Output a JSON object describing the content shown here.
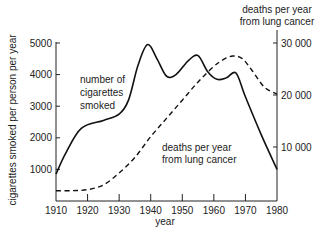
{
  "chart_data": {
    "type": "line",
    "title": "",
    "xlabel": "year",
    "ylabel": "cigarettes smoked per person per year",
    "y2label": [
      "deaths per year",
      "from lung cancer"
    ],
    "x_ticks": [
      1910,
      1920,
      1930,
      1940,
      1950,
      1960,
      1970,
      1980
    ],
    "y_ticks": [
      1000,
      2000,
      3000,
      4000,
      5000
    ],
    "y2_ticks": [
      10000,
      20000,
      30000
    ],
    "y2_tick_labels": [
      "10 000",
      "20 000",
      "30 000"
    ],
    "xlim": [
      1910,
      1980
    ],
    "ylim": [
      0,
      5000
    ],
    "y2lim": [
      0,
      30000
    ],
    "grid": false,
    "series": [
      {
        "name": "number of cigarettes smoked",
        "label_lines": [
          "number of",
          "cigarettes",
          "smoked"
        ],
        "axis": "left",
        "style": "solid",
        "x": [
          1910,
          1913,
          1918,
          1925,
          1930,
          1933,
          1936,
          1939,
          1942,
          1945,
          1948,
          1952,
          1955,
          1958,
          1961,
          1964,
          1967,
          1970,
          1975,
          1980
        ],
        "values": [
          850,
          1500,
          2300,
          2550,
          2750,
          3200,
          4300,
          4950,
          4500,
          3950,
          4000,
          4450,
          4600,
          4100,
          3850,
          3900,
          4050,
          3300,
          2100,
          1000
        ]
      },
      {
        "name": "deaths per year from lung cancer",
        "label_lines": [
          "deaths per year",
          "from lung cancer"
        ],
        "axis": "right",
        "style": "dashed",
        "x": [
          1910,
          1915,
          1920,
          1925,
          1930,
          1935,
          1940,
          1945,
          1950,
          1955,
          1960,
          1963,
          1966,
          1969,
          1972,
          1976,
          1980
        ],
        "values": [
          1600,
          1600,
          1800,
          2700,
          5000,
          8000,
          12000,
          15500,
          19000,
          22500,
          25500,
          26800,
          27500,
          27000,
          24800,
          21500,
          20200
        ]
      }
    ]
  }
}
